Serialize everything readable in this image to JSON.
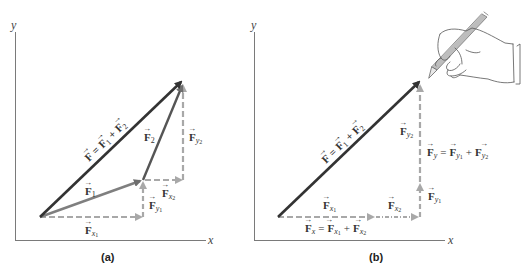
{
  "colors": {
    "resultant": "#333333",
    "component_vector": "#6e6e6e",
    "dashed_component": "#a8a8a8",
    "axis": "#7a7a7a",
    "background": "#ffffff"
  },
  "panels": [
    {
      "id": "a",
      "label": "(a)",
      "axes": {
        "x_label": "x",
        "y_label": "y"
      },
      "vectors": {
        "F": {
          "label": "F = F1 + F2",
          "from": [
            40,
            217
          ],
          "to": [
            183,
            80
          ]
        },
        "F1": {
          "label": "F1",
          "from": [
            40,
            217
          ],
          "to": [
            143,
            180
          ]
        },
        "F2": {
          "label": "F2",
          "from": [
            143,
            180
          ],
          "to": [
            183,
            83
          ]
        },
        "Fx1": {
          "label": "Fx1",
          "from": [
            40,
            217
          ],
          "to": [
            143,
            217
          ]
        },
        "Fy1": {
          "label": "Fy1",
          "from": [
            143,
            217
          ],
          "to": [
            143,
            180
          ]
        },
        "Fx2": {
          "label": "Fx2",
          "from": [
            143,
            180
          ],
          "to": [
            183,
            180
          ]
        },
        "Fy2": {
          "label": "Fy2",
          "from": [
            183,
            180
          ],
          "to": [
            183,
            83
          ]
        }
      }
    },
    {
      "id": "b",
      "label": "(b)",
      "axes": {
        "x_label": "x",
        "y_label": "y"
      },
      "vectors": {
        "F": {
          "label": "F = F1 + F2",
          "from": [
            278,
            217
          ],
          "to": [
            421,
            80
          ]
        },
        "Fx1": {
          "label": "Fx1",
          "from": [
            278,
            217
          ],
          "to": [
            375,
            217
          ]
        },
        "Fx2": {
          "label": "Fx2",
          "from": [
            375,
            217
          ],
          "to": [
            420,
            217
          ]
        },
        "Fy1": {
          "label": "Fy1",
          "from": [
            420,
            217
          ],
          "to": [
            420,
            182
          ]
        },
        "Fy2": {
          "label": "Fy2",
          "from": [
            420,
            182
          ],
          "to": [
            420,
            83
          ]
        }
      },
      "equations": {
        "Fx": "Fx = Fx1 + Fx2",
        "Fy": "Fy = Fy1 + Fy2"
      },
      "illustration": "hand-holding-pencil"
    }
  ],
  "text": {
    "F": "F",
    "eq": "=",
    "plus": "+",
    "sub_1": "1",
    "sub_2": "2",
    "sub_x": "x",
    "sub_y": "y",
    "x_axis": "x",
    "y_axis": "y",
    "panel_a": "(a)",
    "panel_b": "(b)"
  }
}
